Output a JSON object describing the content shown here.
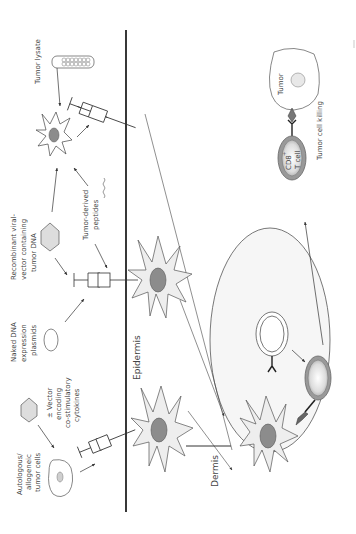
{
  "figure": {
    "orientation": "rotated-90-ccw",
    "layers": {
      "epidermis": "Epidermis",
      "dermis": "Dermis"
    },
    "antigen_sources": [
      {
        "id": "tumor-lysate",
        "lines": [
          "Tumor lysate"
        ]
      },
      {
        "id": "recombinant-viral-vector",
        "lines": [
          "Recombinant viral-",
          "vector containing",
          "tumor DNA"
        ]
      },
      {
        "id": "tumor-derived-peptides",
        "lines": [
          "Tumor-derived",
          "peptides"
        ]
      },
      {
        "id": "naked-dna",
        "lines": [
          "Naked DNA",
          "expression",
          "plasmids"
        ]
      },
      {
        "id": "costim-vector",
        "lines": [
          "± Vector",
          "encoding",
          "co-stimulatory",
          "cytokines"
        ]
      },
      {
        "id": "tumor-cells",
        "lines": [
          "Autologous/",
          "allogeneic",
          "tumor cells"
        ]
      }
    ],
    "effector": {
      "tumor_label": "Tumor",
      "tcell_lines": [
        "CD8",
        "T cell"
      ],
      "tcell_superscript": "+",
      "killing_label": "Tumor cell killing"
    },
    "colors": {
      "line": "#333333",
      "cell_fill": "#eeeeee",
      "nucleus_fill": "#8c8c8c",
      "lymph_node_fill": "#f6f6f6",
      "hexagon_fill": "#dddddd",
      "tcell_ring": "#9a9a9a"
    }
  }
}
